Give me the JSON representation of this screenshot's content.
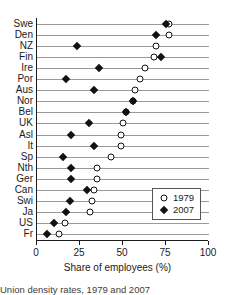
{
  "chart_data": {
    "type": "scatter",
    "title": "",
    "xlabel": "Share of employees (%)",
    "ylabel": "",
    "xlim": [
      0,
      100
    ],
    "xticks": [
      0,
      25,
      50,
      75,
      100
    ],
    "xticklabels": [
      "0",
      "25",
      "50",
      "75",
      "100"
    ],
    "grid": true,
    "grid_axis": "y",
    "legend_position": "bottom-right",
    "categories": [
      "Swe",
      "Den",
      "NZ",
      "Fin",
      "Ire",
      "Por",
      "Aus",
      "Nor",
      "Bel",
      "UK",
      "Asl",
      "It",
      "Sp",
      "Nth",
      "Ger",
      "Can",
      "Swi",
      "Ja",
      "US",
      "Fr"
    ],
    "series": [
      {
        "name": "1979",
        "marker": "open-circle",
        "color": "#111111",
        "values": [
          77,
          77,
          69,
          68,
          63,
          60,
          57,
          56,
          52,
          50,
          49,
          49,
          43,
          35,
          35,
          33,
          32,
          31,
          16,
          13
        ]
      },
      {
        "name": "2007",
        "marker": "filled-diamond",
        "color": "#111111",
        "values": [
          75,
          69,
          23,
          72,
          36,
          17,
          33,
          56,
          52,
          30,
          20,
          33,
          15,
          20,
          20,
          29,
          19,
          17,
          10,
          6
        ]
      }
    ]
  },
  "axis": {
    "x_title": "Share of employees (%)"
  },
  "legend": {
    "items": [
      {
        "label": "1979",
        "marker": "open-circle"
      },
      {
        "label": "2007",
        "marker": "filled-diamond"
      }
    ]
  },
  "caption": {
    "text": "Union density rates, 1979 and 2007"
  }
}
